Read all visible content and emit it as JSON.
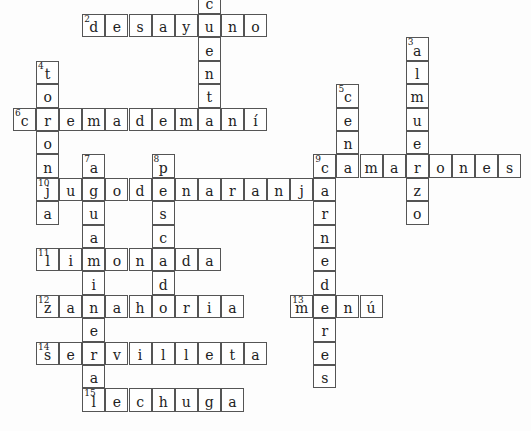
{
  "grid": {
    "origin_x": 13,
    "origin_y": -9.4,
    "cell_w": 23.1,
    "cell_h": 23.4
  },
  "words": [
    {
      "number": "1",
      "direction": "down",
      "row": 0,
      "col": 8,
      "answer": "cuenta"
    },
    {
      "number": "2",
      "direction": "across",
      "row": 1,
      "col": 3,
      "answer": "desayuno"
    },
    {
      "number": "3",
      "direction": "down",
      "row": 2,
      "col": 17,
      "answer": "almuerzo"
    },
    {
      "number": "4",
      "direction": "down",
      "row": 3,
      "col": 1,
      "answer": "toronja"
    },
    {
      "number": "5",
      "direction": "down",
      "row": 4,
      "col": 14,
      "answer": "cena"
    },
    {
      "number": "6",
      "direction": "across",
      "row": 5,
      "col": 0,
      "answer": "cremademaní"
    },
    {
      "number": "7",
      "direction": "down",
      "row": 7,
      "col": 3,
      "answer": "aguamineral"
    },
    {
      "number": "8",
      "direction": "down",
      "row": 7,
      "col": 6,
      "answer": "pescado"
    },
    {
      "number": "9",
      "direction": "across",
      "row": 7,
      "col": 13,
      "answer": "camarones"
    },
    {
      "number": "9",
      "direction": "down",
      "row": 7,
      "col": 13,
      "answer": "carnederes"
    },
    {
      "number": "10",
      "direction": "across",
      "row": 8,
      "col": 1,
      "answer": "jugodenaranja"
    },
    {
      "number": "11",
      "direction": "across",
      "row": 11,
      "col": 1,
      "answer": "limonada"
    },
    {
      "number": "12",
      "direction": "across",
      "row": 13,
      "col": 1,
      "answer": "zanahoria"
    },
    {
      "number": "13",
      "direction": "across",
      "row": 13,
      "col": 12,
      "answer": "menú"
    },
    {
      "number": "14",
      "direction": "across",
      "row": 15,
      "col": 1,
      "answer": "servilleta"
    },
    {
      "number": "15",
      "direction": "across",
      "row": 17,
      "col": 3,
      "answer": "lechuga"
    }
  ],
  "hidden_numbers": [
    "1"
  ]
}
